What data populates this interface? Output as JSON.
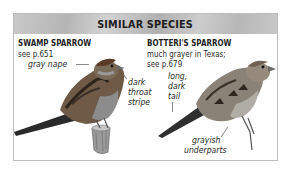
{
  "panel": {
    "title": "SIMILAR SPECIES"
  },
  "species": [
    {
      "name": "SWAMP SPARROW",
      "reference": "see p.651",
      "notes": [
        {
          "lines": [
            "gray nape"
          ]
        },
        {
          "lines": [
            "dark",
            "throat",
            "stripe"
          ]
        }
      ],
      "illustration": "swamp-sparrow-perched-on-stump"
    },
    {
      "name": "BOTTERI'S SPARROW",
      "reference_lines": [
        "much grayer in Texas;",
        "see p.679"
      ],
      "notes": [
        {
          "lines": [
            "long,",
            "dark",
            "tail"
          ]
        },
        {
          "lines": [
            "grayish",
            "underparts"
          ]
        }
      ],
      "illustration": "botteris-sparrow-perched"
    }
  ],
  "colors": {
    "header_bg": "#bfbfbf",
    "border": "#bdbdbd",
    "text": "#1e1e1e"
  }
}
